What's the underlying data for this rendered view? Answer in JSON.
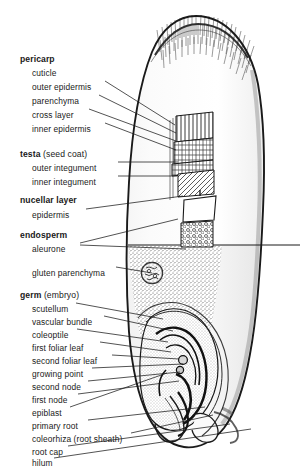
{
  "figure": {
    "background_color": "#ffffff",
    "ink_color": "#1a1a1a",
    "width": 300,
    "height": 465
  },
  "labels": [
    {
      "id": "pericarp",
      "text": "pericarp",
      "suffix": "",
      "bold": true,
      "x": 20,
      "y": 55,
      "indent": 0
    },
    {
      "id": "cuticle",
      "text": "cuticle",
      "suffix": "",
      "bold": false,
      "x": 32,
      "y": 69,
      "indent": 1
    },
    {
      "id": "outer-epidermis",
      "text": "outer epidermis",
      "suffix": "",
      "bold": false,
      "x": 32,
      "y": 83,
      "indent": 1
    },
    {
      "id": "parenchyma",
      "text": "parenchyma",
      "suffix": "",
      "bold": false,
      "x": 32,
      "y": 97,
      "indent": 1
    },
    {
      "id": "cross-layer",
      "text": "cross layer",
      "suffix": "",
      "bold": false,
      "x": 32,
      "y": 111,
      "indent": 1
    },
    {
      "id": "inner-epidermis",
      "text": "inner epidermis",
      "suffix": "",
      "bold": false,
      "x": 32,
      "y": 125,
      "indent": 1
    },
    {
      "id": "testa",
      "text": "testa",
      "suffix": " (seed coat)",
      "bold": true,
      "x": 20,
      "y": 150,
      "indent": 0
    },
    {
      "id": "outer-integument",
      "text": "outer integument",
      "suffix": "",
      "bold": false,
      "x": 32,
      "y": 164,
      "indent": 1
    },
    {
      "id": "inner-integument",
      "text": "inner integument",
      "suffix": "",
      "bold": false,
      "x": 32,
      "y": 178,
      "indent": 1
    },
    {
      "id": "nucellar-layer",
      "text": "nucellar layer",
      "suffix": "",
      "bold": true,
      "x": 20,
      "y": 196,
      "indent": 0
    },
    {
      "id": "epidermis",
      "text": "epidermis",
      "suffix": "",
      "bold": false,
      "x": 32,
      "y": 211,
      "indent": 1
    },
    {
      "id": "endosperm",
      "text": "endosperm",
      "suffix": "",
      "bold": true,
      "x": 20,
      "y": 231,
      "indent": 0
    },
    {
      "id": "aleurone",
      "text": "aleurone",
      "suffix": "",
      "bold": false,
      "x": 32,
      "y": 245,
      "indent": 1
    },
    {
      "id": "gluten-parenchyma",
      "text": "gluten parenchyma",
      "suffix": "",
      "bold": false,
      "x": 32,
      "y": 269,
      "indent": 1
    },
    {
      "id": "germ",
      "text": "germ",
      "suffix": " (embryo)",
      "bold": true,
      "x": 20,
      "y": 291,
      "indent": 0
    },
    {
      "id": "scutellum",
      "text": "scutellum",
      "suffix": "",
      "bold": false,
      "x": 32,
      "y": 305,
      "indent": 1
    },
    {
      "id": "vascular-bundle",
      "text": "vascular bundle",
      "suffix": "",
      "bold": false,
      "x": 32,
      "y": 318,
      "indent": 1
    },
    {
      "id": "coleoptile",
      "text": "coleoptile",
      "suffix": "",
      "bold": false,
      "x": 32,
      "y": 331,
      "indent": 1
    },
    {
      "id": "first-foliar-leaf",
      "text": "first foliar leaf",
      "suffix": "",
      "bold": false,
      "x": 32,
      "y": 344,
      "indent": 1
    },
    {
      "id": "second-foliar-leaf",
      "text": "second foliar leaf",
      "suffix": "",
      "bold": false,
      "x": 32,
      "y": 357,
      "indent": 1
    },
    {
      "id": "growing-point",
      "text": "growing point",
      "suffix": "",
      "bold": false,
      "x": 32,
      "y": 370,
      "indent": 1
    },
    {
      "id": "second-node",
      "text": "second node",
      "suffix": "",
      "bold": false,
      "x": 32,
      "y": 383,
      "indent": 1
    },
    {
      "id": "first-node",
      "text": "first node",
      "suffix": "",
      "bold": false,
      "x": 32,
      "y": 396,
      "indent": 1
    },
    {
      "id": "epiblast",
      "text": "epiblast",
      "suffix": "",
      "bold": false,
      "x": 32,
      "y": 409,
      "indent": 1
    },
    {
      "id": "primary-root",
      "text": "primary root",
      "suffix": "",
      "bold": false,
      "x": 32,
      "y": 422,
      "indent": 1
    },
    {
      "id": "coleorhiza",
      "text": "coleorhiza",
      "suffix": " (root sheath)",
      "bold": false,
      "x": 32,
      "y": 435,
      "indent": 1
    },
    {
      "id": "root-cap",
      "text": "root cap",
      "suffix": "",
      "bold": false,
      "x": 32,
      "y": 448,
      "indent": 1
    },
    {
      "id": "hilum",
      "text": "hilum",
      "suffix": "",
      "bold": false,
      "x": 32,
      "y": 459,
      "indent": 1
    }
  ],
  "leaders": [
    {
      "for": "outer-epidermis",
      "d": "M105,81  L175,125"
    },
    {
      "for": "parenchyma",
      "d": "M99,95   L176,133"
    },
    {
      "for": "cross-layer",
      "d": "M89,109  L176,141"
    },
    {
      "for": "inner-epidermis",
      "d": "M105,123 L176,150"
    },
    {
      "for": "outer-integument",
      "d": "M118,162 L178,162"
    },
    {
      "for": "inner-integument",
      "d": "M118,176 L177,176"
    },
    {
      "for": "epidermis",
      "d": "M86,209  L183,196"
    },
    {
      "for": "aleurone-upper",
      "d": "M80,243  L178,219"
    },
    {
      "for": "aleurone-lower",
      "d": "M80,245  L186,249"
    },
    {
      "for": "gluten-parenchyma",
      "d": "M116,267 L152,273"
    },
    {
      "for": "scutellum",
      "d": "M76,303  L163,319"
    },
    {
      "for": "vascular-bundle",
      "d": "M104,316 L173,331"
    },
    {
      "for": "coleoptile",
      "d": "M77,329  L168,342"
    },
    {
      "for": "first-foliar-leaf",
      "d": "M100,342 L171,352"
    },
    {
      "for": "second-foliar-leaf",
      "d": "M112,355 L179,359"
    },
    {
      "for": "growing-point",
      "d": "M92,368  L183,364"
    },
    {
      "for": "second-node",
      "d": "M88,381  L180,372"
    },
    {
      "for": "first-node",
      "d": "M78,394  L179,381"
    },
    {
      "for": "epiblast",
      "d": "M70,407  L167,373"
    },
    {
      "for": "primary-root",
      "d": "M88,420  L205,407"
    },
    {
      "for": "coleorhiza",
      "d": "M131,433 L213,415"
    },
    {
      "for": "root-cap",
      "d": "M68,446  L230,424"
    },
    {
      "for": "hilum",
      "d": "M54,458  L251,429"
    }
  ],
  "tissue_blocks": [
    {
      "id": "cross-layer-block",
      "pattern": "vertical-hatch",
      "x": 176,
      "y": 114,
      "w": 37,
      "h": 26
    },
    {
      "id": "outer-integument-block",
      "pattern": "brick-cells",
      "x": 176,
      "y": 140,
      "w": 37,
      "h": 32
    },
    {
      "id": "inner-integument-block",
      "pattern": "diagonal-hatch",
      "x": 178,
      "y": 172,
      "w": 36,
      "h": 24
    },
    {
      "id": "nucellar-epidermis-block",
      "pattern": "blank-cell",
      "x": 182,
      "y": 196,
      "w": 34,
      "h": 26
    },
    {
      "id": "aleurone-block",
      "pattern": "stipple-cells",
      "x": 180,
      "y": 222,
      "w": 33,
      "h": 26
    }
  ]
}
